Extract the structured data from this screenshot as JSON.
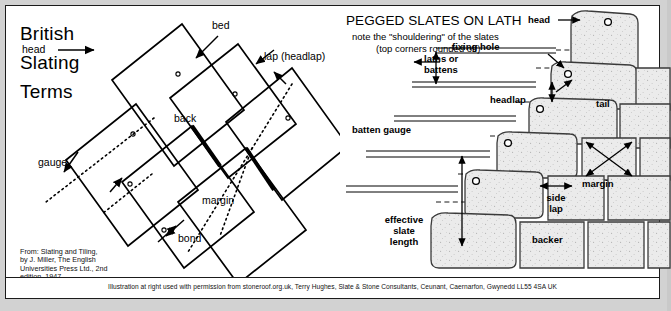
{
  "left_panel": {
    "title_lines": [
      "British",
      "Slating",
      "Terms"
    ],
    "labels": {
      "head": "head",
      "bed": "bed",
      "lap": "lap (headlap)",
      "back": "back",
      "gauge": "gauge",
      "margin": "margin",
      "bond": "bond"
    },
    "citation_lines": [
      "From: Slating and Tiling,",
      "by J. Miller, The English",
      "Universities Press Ltd., 2nd",
      "edition, 1947"
    ]
  },
  "right_panel": {
    "title": "PEGGED SLATES ON LATH",
    "subtitle_lines": [
      "note the \"shouldering\" of the slates",
      "(top corners rounded off)"
    ],
    "labels": {
      "head": "head",
      "fixing_hole": "fixing hole",
      "laths_or_battens": [
        "laths or",
        "battens"
      ],
      "headlap": "headlap",
      "tail": "tail",
      "batten_gauge": "batten gauge",
      "margin": "margin",
      "side_lap": [
        "side",
        "lap"
      ],
      "effective_slate_length": [
        "effective",
        "slate",
        "length"
      ],
      "backer": "backer"
    }
  },
  "credit": "Illustration at right used with permission from stoneroof.org.uk, Terry Hughes, Slate & Stone Consultants, Ceunant, Caernarfon, Gwynedd LL55 4SA UK",
  "colors": {
    "ink": "#000000",
    "page": "#ffffff",
    "mat": "#d2d2d2",
    "slate_fill": "#e8e8e8"
  }
}
